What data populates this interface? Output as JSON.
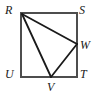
{
  "figure": {
    "type": "geometry-diagram",
    "canvas": {
      "width": 99,
      "height": 96,
      "background": "#ffffff"
    },
    "colors": {
      "square_stroke": "#4d4d4d",
      "inner_stroke": "#1a1a1a",
      "label_color": "#1a1a1a"
    },
    "square": {
      "name": "RSTU",
      "left": 21,
      "top": 13,
      "right": 77,
      "bottom": 77,
      "stroke_width": 2
    },
    "points": [
      {
        "id": "R",
        "label": "R",
        "x": 21,
        "y": 13,
        "on": "square-corner-top-left"
      },
      {
        "id": "S",
        "label": "S",
        "x": 77,
        "y": 13,
        "on": "square-corner-top-right"
      },
      {
        "id": "T",
        "label": "T",
        "x": 77,
        "y": 77,
        "on": "square-corner-bottom-right"
      },
      {
        "id": "U",
        "label": "U",
        "x": 21,
        "y": 77,
        "on": "square-corner-bottom-left"
      },
      {
        "id": "W",
        "label": "W",
        "x": 77,
        "y": 44,
        "on": "side-ST"
      },
      {
        "id": "V",
        "label": "V",
        "x": 51,
        "y": 77,
        "on": "side-UT"
      }
    ],
    "segments": [
      {
        "id": "RS",
        "from": "R",
        "to": "S",
        "kind": "square-side"
      },
      {
        "id": "ST",
        "from": "S",
        "to": "T",
        "kind": "square-side"
      },
      {
        "id": "TU",
        "from": "T",
        "to": "U",
        "kind": "square-side"
      },
      {
        "id": "UR",
        "from": "U",
        "to": "R",
        "kind": "square-side"
      },
      {
        "id": "RW",
        "from": "R",
        "to": "W",
        "kind": "inner"
      },
      {
        "id": "RV",
        "from": "R",
        "to": "V",
        "kind": "inner"
      },
      {
        "id": "VW",
        "from": "V",
        "to": "W",
        "kind": "inner"
      }
    ],
    "labels": {
      "R": "R",
      "S": "S",
      "T": "T",
      "U": "U",
      "V": "V",
      "W": "W"
    }
  }
}
